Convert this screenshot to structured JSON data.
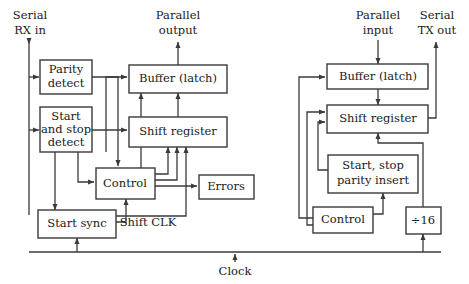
{
  "diagram": {
    "canvas": {
      "width": 469,
      "height": 284
    },
    "colors": {
      "background": "#ffffff",
      "line": "#3a3a3a",
      "text": "#1a1a1a",
      "box_fill": "#ffffff"
    },
    "receiver": {
      "io": {
        "serial_rx_line1": "Serial",
        "serial_rx_line2": "RX in",
        "parallel_out_line1": "Parallel",
        "parallel_out_line2": "output"
      },
      "blocks": {
        "parity_detect_line1": "Parity",
        "parity_detect_line2": "detect",
        "start_stop_detect_line1": "Start",
        "start_stop_detect_line2": "and stop",
        "start_stop_detect_line3": "detect",
        "buffer_latch": "Buffer (latch)",
        "shift_register": "Shift register",
        "control": "Control",
        "errors": "Errors",
        "start_sync": "Start sync"
      },
      "wire_labels": {
        "shift_clk": "Shift CLK"
      }
    },
    "transmitter": {
      "io": {
        "parallel_in_line1": "Parallel",
        "parallel_in_line2": "input",
        "serial_tx_line1": "Serial",
        "serial_tx_line2": "TX out"
      },
      "blocks": {
        "buffer_latch": "Buffer (latch)",
        "shift_register": "Shift register",
        "start_stop_parity_line1": "Start, stop",
        "start_stop_parity_line2": "parity insert",
        "control": "Control",
        "divider": "÷16"
      }
    },
    "common": {
      "clock_label": "Clock"
    }
  }
}
